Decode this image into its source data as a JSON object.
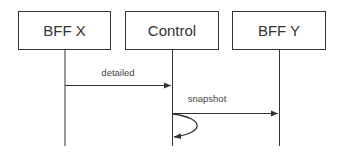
{
  "diagram": {
    "type": "sequence",
    "colors": {
      "stroke": "#333333",
      "text": "#333333",
      "background": "#ffffff"
    },
    "participants": [
      {
        "id": "bffx",
        "label": "BFF X"
      },
      {
        "id": "control",
        "label": "Control"
      },
      {
        "id": "bffy",
        "label": "BFF Y"
      }
    ],
    "messages": [
      {
        "from": "BFF X",
        "to": "Control",
        "label": "detailed"
      },
      {
        "from": "Control",
        "to": "BFF Y",
        "label": "snapshot"
      },
      {
        "from": "Control",
        "to": "Control",
        "label": ""
      }
    ]
  }
}
